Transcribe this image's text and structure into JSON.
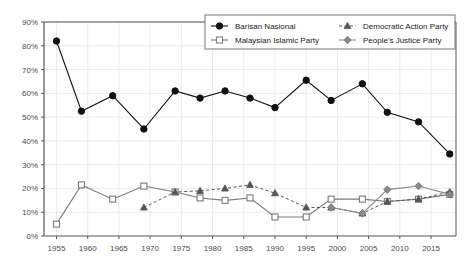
{
  "chart_data": {
    "type": "line",
    "title": "",
    "xlabel": "",
    "ylabel": "",
    "xlim": [
      1953,
      2019
    ],
    "ylim": [
      0,
      90
    ],
    "grid": true,
    "legend_position": "top-right",
    "x": [
      1955,
      1959,
      1964,
      1969,
      1974,
      1978,
      1982,
      1986,
      1990,
      1995,
      1999,
      2004,
      2008,
      2013,
      2018
    ],
    "xticks": [
      "1955",
      "1960",
      "1965",
      "1970",
      "1975",
      "1980",
      "1985",
      "1990",
      "1995",
      "2000",
      "2005",
      "2010",
      "2015"
    ],
    "xtick_values": [
      1955,
      1960,
      1965,
      1970,
      1975,
      1980,
      1985,
      1990,
      1995,
      2000,
      2005,
      2010,
      2015
    ],
    "yticks": [
      "0%",
      "10%",
      "20%",
      "30%",
      "40%",
      "50%",
      "60%",
      "70%",
      "80%",
      "90%"
    ],
    "ytick_values": [
      0,
      10,
      20,
      30,
      40,
      50,
      60,
      70,
      80,
      90
    ],
    "series": [
      {
        "name": "Barisan Nasional",
        "marker": "circle-filled",
        "color": "#111111",
        "line": "solid",
        "x": [
          1955,
          1959,
          1964,
          1969,
          1974,
          1978,
          1982,
          1986,
          1990,
          1995,
          1999,
          2004,
          2008,
          2013,
          2018
        ],
        "values": [
          82,
          52.5,
          59,
          45,
          61,
          58,
          61,
          58,
          54,
          65.5,
          57,
          64,
          52,
          48,
          34.5
        ]
      },
      {
        "name": "Malaysian Islamic Party",
        "marker": "square-open",
        "color": "#7a7a7a",
        "line": "solid",
        "x": [
          1955,
          1959,
          1964,
          1969,
          1974,
          1978,
          1982,
          1986,
          1990,
          1995,
          1999,
          2004,
          2008,
          2013,
          2018
        ],
        "values": [
          5,
          21.5,
          15.5,
          21,
          18.5,
          16,
          15,
          16,
          8,
          8,
          15.5,
          15.5,
          14.5,
          15.5,
          17.5
        ]
      },
      {
        "name": "Democratic Action Party",
        "marker": "triangle-filled",
        "color": "#555555",
        "line": "dashed",
        "x": [
          1969,
          1974,
          1978,
          1982,
          1986,
          1990,
          1995,
          1999,
          2004,
          2008,
          2013,
          2018
        ],
        "values": [
          12,
          18.5,
          19,
          20,
          21.5,
          18,
          12,
          12,
          9.5,
          14.5,
          15.5,
          18.5
        ]
      },
      {
        "name": "People's Justice Party",
        "marker": "diamond-filled",
        "color": "#8a8a8a",
        "line": "solid",
        "x": [
          1999,
          2004,
          2008,
          2013,
          2018
        ],
        "values": [
          12,
          9.5,
          19.5,
          21,
          17.5
        ]
      }
    ]
  },
  "legend": {
    "entries": [
      {
        "label": "Barisan Nasional"
      },
      {
        "label": "Democratic Action Party"
      },
      {
        "label": "Malaysian Islamic Party"
      },
      {
        "label": "People's Justice Party"
      }
    ]
  },
  "colors": {
    "axis": "#555555",
    "grid": "#eaeaea",
    "plot_background": "#ffffff",
    "barisan": "#111111",
    "pas": "#7a7a7a",
    "dap": "#555555",
    "pkr": "#8a8a8a"
  }
}
